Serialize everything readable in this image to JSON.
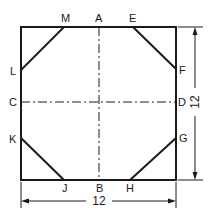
{
  "diagram": {
    "points": {
      "A": "A",
      "B": "B",
      "C": "C",
      "D": "D",
      "E": "E",
      "F": "F",
      "G": "G",
      "H": "H",
      "J": "J",
      "K": "K",
      "L": "L",
      "M": "M"
    },
    "dimensions": {
      "width": "12",
      "height": "12"
    },
    "colors": {
      "line": "#1a1a1a",
      "background": "#ffffff"
    }
  }
}
